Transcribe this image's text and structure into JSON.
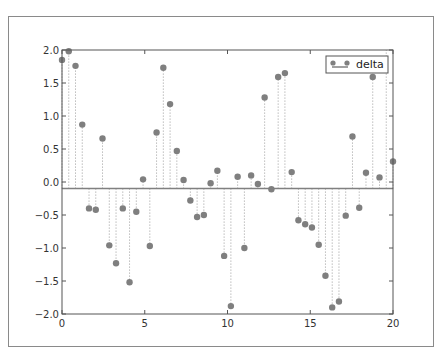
{
  "chart_data": {
    "type": "stem",
    "title": "",
    "xlabel": "",
    "ylabel": "",
    "xlim": [
      0,
      20
    ],
    "ylim": [
      -2.0,
      2.0
    ],
    "grid": false,
    "legend_position": "upper right",
    "baseline": -0.1,
    "x_ticks": [
      "0",
      "5",
      "10",
      "15",
      "20"
    ],
    "y_ticks": [
      "2.0",
      "1.5",
      "1.0",
      "0.5",
      "0.0",
      "−0.5",
      "−1.0",
      "−1.5",
      "−2.0"
    ],
    "series": [
      {
        "name": "delta",
        "x_start": 0,
        "x_end": 20,
        "count": 50,
        "values": [
          1.85,
          1.98,
          1.76,
          0.87,
          -0.4,
          -0.42,
          0.66,
          -0.96,
          -1.23,
          -0.4,
          -1.52,
          -0.45,
          0.04,
          -0.97,
          0.75,
          1.73,
          1.18,
          0.47,
          0.03,
          -0.28,
          -0.53,
          -0.5,
          -0.02,
          0.17,
          -1.12,
          -1.88,
          0.08,
          -1.0,
          0.1,
          -0.03,
          1.28,
          -0.11,
          1.59,
          1.65,
          0.15,
          -0.58,
          -0.64,
          -0.69,
          -0.95,
          -1.42,
          -1.9,
          -1.81,
          -0.51,
          0.69,
          -0.39,
          0.14,
          1.59,
          0.07,
          2.1,
          0.31
        ]
      }
    ]
  },
  "colors": {
    "marker": "#7f7f7f",
    "stem": "#9a9a9a",
    "baseline": "#808080",
    "axis": "#555555"
  },
  "legend": {
    "label": "delta"
  }
}
